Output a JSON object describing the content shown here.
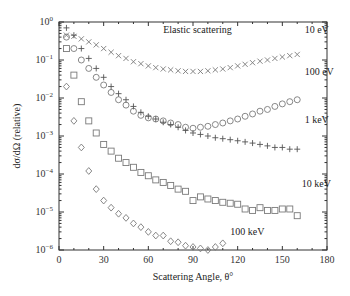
{
  "chart_data": {
    "type": "scatter",
    "title": "Elastic scattering",
    "xlabel": "Scattering Angle, θ°",
    "ylabel": "dσ/dΩ (relative)",
    "xlim": [
      0,
      180
    ],
    "ylim": [
      1e-06,
      1
    ],
    "yscale": "log",
    "x_ticks": [
      0,
      30,
      60,
      90,
      120,
      150,
      180
    ],
    "y_ticks": [
      "10^0",
      "10^-1",
      "10^-2",
      "10^-3",
      "10^-4",
      "10^-5",
      "10^-6"
    ],
    "grid": false,
    "legend": "inline labels at right of each series",
    "series": [
      {
        "name": "10 eV",
        "marker": "x",
        "x": [
          5,
          10,
          15,
          20,
          25,
          30,
          35,
          40,
          45,
          50,
          55,
          60,
          65,
          70,
          75,
          80,
          85,
          90,
          95,
          100,
          105,
          110,
          115,
          120,
          125,
          130,
          135,
          140,
          145,
          150,
          155,
          160
        ],
        "values": [
          0.45,
          0.42,
          0.36,
          0.3,
          0.25,
          0.2,
          0.16,
          0.13,
          0.11,
          0.09,
          0.08,
          0.07,
          0.063,
          0.058,
          0.055,
          0.052,
          0.05,
          0.05,
          0.05,
          0.052,
          0.055,
          0.058,
          0.063,
          0.07,
          0.077,
          0.085,
          0.093,
          0.1,
          0.11,
          0.12,
          0.13,
          0.14
        ]
      },
      {
        "name": "100 eV",
        "marker": "o",
        "x": [
          5,
          10,
          15,
          20,
          25,
          30,
          35,
          40,
          45,
          50,
          55,
          60,
          65,
          70,
          75,
          80,
          85,
          90,
          95,
          100,
          105,
          110,
          115,
          120,
          125,
          130,
          135,
          140,
          145,
          150,
          155,
          160
        ],
        "values": [
          0.4,
          0.2,
          0.1,
          0.06,
          0.035,
          0.022,
          0.014,
          0.009,
          0.0065,
          0.0045,
          0.0035,
          0.003,
          0.0028,
          0.0025,
          0.0022,
          0.002,
          0.0017,
          0.0016,
          0.0017,
          0.0018,
          0.002,
          0.0022,
          0.0025,
          0.0028,
          0.0033,
          0.0038,
          0.0045,
          0.005,
          0.006,
          0.007,
          0.008,
          0.009
        ]
      },
      {
        "name": "1 keV",
        "marker": "+",
        "x": [
          5,
          10,
          15,
          20,
          25,
          30,
          35,
          40,
          45,
          50,
          55,
          60,
          65,
          70,
          75,
          80,
          85,
          90,
          95,
          100,
          105,
          110,
          115,
          120,
          125,
          130,
          135,
          140,
          145,
          150,
          155,
          160
        ],
        "values": [
          0.7,
          0.45,
          0.2,
          0.11,
          0.06,
          0.035,
          0.02,
          0.013,
          0.009,
          0.006,
          0.0042,
          0.0033,
          0.0028,
          0.0023,
          0.002,
          0.0017,
          0.0014,
          0.0012,
          0.0011,
          0.001,
          0.0009,
          0.00085,
          0.0008,
          0.00075,
          0.0007,
          0.00065,
          0.0006,
          0.00055,
          0.0005,
          0.0005,
          0.00045,
          0.00045
        ]
      },
      {
        "name": "10 keV",
        "marker": "square",
        "x": [
          5,
          10,
          15,
          20,
          25,
          30,
          35,
          40,
          45,
          50,
          55,
          60,
          65,
          70,
          75,
          80,
          85,
          90,
          95,
          100,
          105,
          110,
          115,
          120,
          125,
          130,
          135,
          140,
          145,
          150,
          155,
          160
        ],
        "values": [
          0.2,
          0.04,
          0.008,
          0.0025,
          0.0012,
          0.0006,
          0.0004,
          0.00026,
          0.0002,
          0.00015,
          0.00011,
          9e-05,
          7e-05,
          6e-05,
          5e-05,
          4e-05,
          3.5e-05,
          2e-05,
          2.5e-05,
          2.2e-05,
          2e-05,
          1.8e-05,
          1.7e-05,
          1.6e-05,
          1.2e-05,
          1.1e-05,
          1.3e-05,
          1.1e-05,
          1.1e-05,
          1.2e-05,
          1.2e-05,
          8e-06
        ]
      },
      {
        "name": "100 keV",
        "marker": "diamond",
        "x": [
          5,
          10,
          15,
          20,
          25,
          30,
          35,
          40,
          45,
          50,
          55,
          60,
          65,
          70,
          75,
          80,
          85,
          90,
          95,
          100,
          105,
          110
        ],
        "values": [
          0.02,
          0.0025,
          0.0005,
          0.00012,
          4e-05,
          2e-05,
          1.3e-05,
          9e-06,
          7e-06,
          5e-06,
          4e-06,
          3e-06,
          2.4e-06,
          2.4e-06,
          1.7e-06,
          1.6e-06,
          1.3e-06,
          1.2e-06,
          1.1e-06,
          1e-06,
          1.2e-06,
          1.5e-06
        ]
      }
    ],
    "annotations": [
      {
        "text": "Elastic scattering",
        "x": 70,
        "y": 0.5
      },
      {
        "text": "10 eV",
        "x": 165,
        "y": 0.5
      },
      {
        "text": "100 eV",
        "x": 165,
        "y": 0.04
      },
      {
        "text": "1 keV",
        "x": 165,
        "y": 0.0022
      },
      {
        "text": "10 keV",
        "x": 163,
        "y": 4.5e-05
      },
      {
        "text": "100 keV",
        "x": 115,
        "y": 2.5e-06
      }
    ]
  },
  "labels": {
    "title": "Elastic scattering",
    "xlabel": "Scattering Angle, θ°",
    "ylabel": "dσ/dΩ (relative)"
  }
}
